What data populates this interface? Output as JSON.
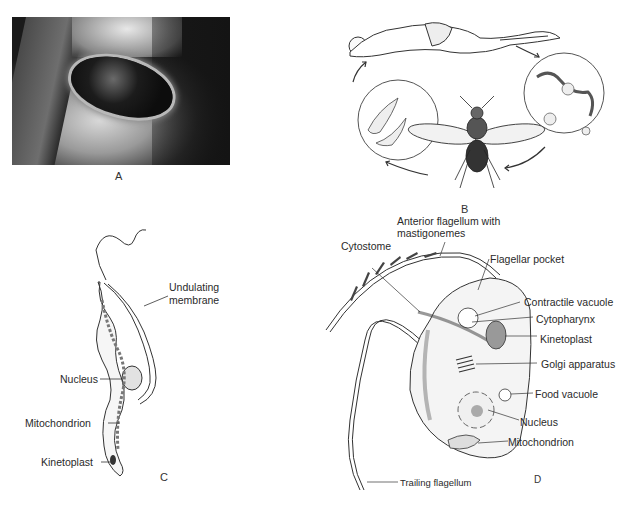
{
  "figure": {
    "panels": {
      "A": {
        "letter": "A",
        "description": "photograph of skin ulcer lesion"
      },
      "B": {
        "letter": "B",
        "description": "life cycle: human host, blood-stage trypanosomes, tsetse fly, fly-stage forms"
      },
      "C": {
        "letter": "C",
        "labels": {
          "undulating_membrane_1": "Undulating",
          "undulating_membrane_2": "membrane",
          "nucleus": "Nucleus",
          "mitochondrion": "Mitochondrion",
          "kinetoplast": "Kinetoplast"
        }
      },
      "D": {
        "letter": "D",
        "labels": {
          "anterior_flagellum_1": "Anterior flagellum with",
          "anterior_flagellum_2": "mastigonemes",
          "cytostome": "Cytostome",
          "flagellar_pocket": "Flagellar pocket",
          "contractile_vacuole": "Contractile vacuole",
          "cytopharynx": "Cytopharynx",
          "kinetoplast": "Kinetoplast",
          "golgi": "Golgi apparatus",
          "food_vacuole": "Food vacuole",
          "nucleus": "Nucleus",
          "mitochondrion": "Mitochondrion",
          "trailing_flagellum": "Trailing flagellum"
        }
      }
    },
    "caption_fragment": ""
  }
}
